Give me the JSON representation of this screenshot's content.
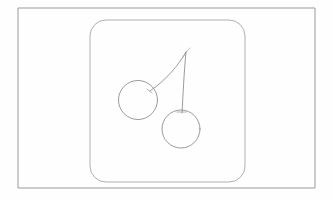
{
  "canvas": {
    "width": 333,
    "height": 200,
    "background_color": "#fefefe",
    "title": "Cherries line drawing"
  },
  "outer_frame": {
    "name": "outer-rectangle-border",
    "x": 18,
    "y": 8,
    "width": 297,
    "height": 180,
    "stroke_color": "#9a9a9a",
    "stroke_width": 1,
    "fill": "none"
  },
  "inner_panel": {
    "name": "rounded-rectangle-panel",
    "x": 90,
    "y": 20,
    "width": 155,
    "height": 162,
    "corner_radius": 16,
    "stroke_color": "#b0b0b0",
    "stroke_width": 1,
    "fill": "none"
  },
  "drawing": {
    "subject": "cherries",
    "stroke_color": "#8e8e8e",
    "stroke_width": 0.9,
    "left_cherry": {
      "name": "left-cherry-circle",
      "cx": 138,
      "cy": 100,
      "r": 19.5
    },
    "right_cherry": {
      "name": "right-cherry-circle",
      "cx": 181,
      "cy": 129,
      "r": 19
    },
    "left_stem": {
      "name": "left-cherry-stem",
      "path": "M 186 52 C 178 66 166 80 150 91"
    },
    "right_stem": {
      "name": "right-cherry-stem",
      "path": "M 186 52 C 184 72 183 96 182 113"
    },
    "stem_tip": {
      "name": "stem-tip-flick",
      "path": "M 190 48 C 188 50 186 52 183 57"
    },
    "left_attach_tick": {
      "name": "left-stem-attachment-tick",
      "path": "M 147 89 L 152 93"
    },
    "right_attach_tick": {
      "name": "right-stem-attachment-tick",
      "path": "M 177 112 L 186 112"
    }
  }
}
